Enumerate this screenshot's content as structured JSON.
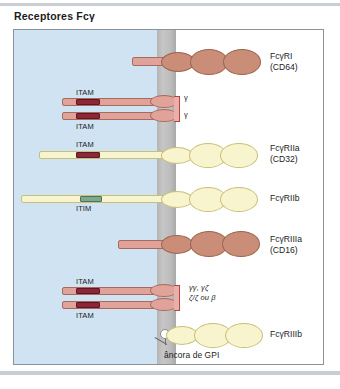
{
  "figure": {
    "title": "Receptores Fcγ",
    "regions": {
      "cytoplasm": "cytoplasm",
      "membrane": "plasma-membrane",
      "extracellular": "extracellular"
    },
    "colors": {
      "cytoplasm": "#cfe3f2",
      "membrane": "#bdbdbd",
      "ig_domain_brown": "#c98d78",
      "ig_domain_yellow": "#f8f4cd",
      "itam_box": "#8d2738",
      "itim_box": "#7fa98b",
      "stalk_pink": "#e0a299",
      "frame_border": "#8d9298"
    }
  },
  "receptors": [
    {
      "id": "fcgri",
      "name": "FcγRI",
      "cd": "(CD64)",
      "ig_domains": 3,
      "chain_tags": []
    },
    {
      "id": "fcgri-gamma",
      "name": "",
      "cd": "",
      "motifs": [
        "ITAM",
        "ITAM"
      ],
      "chain_tags": [
        "γ",
        "γ"
      ]
    },
    {
      "id": "fcgriia",
      "name": "FcγRIIa",
      "cd": "(CD32)",
      "ig_domains": 2,
      "motifs": [
        "ITAM"
      ]
    },
    {
      "id": "fcgriib",
      "name": "FcγRIIb",
      "cd": "",
      "ig_domains": 2,
      "motifs": [
        "ITIM"
      ]
    },
    {
      "id": "fcgriiia",
      "name": "FcγRIIIa",
      "cd": "(CD16)",
      "ig_domains": 2,
      "motifs": []
    },
    {
      "id": "fcgriiia-chains",
      "name": "",
      "cd": "",
      "motifs": [
        "ITAM",
        "ITAM"
      ],
      "chain_tags": [
        "γγ, γζ",
        "ζ/ζ ou β"
      ]
    },
    {
      "id": "fcgriiib",
      "name": "FcγRIIIb",
      "cd": "",
      "ig_domains": 2,
      "anchor": "âncora de GPI"
    }
  ],
  "labels": {
    "itam_1": "ITAM",
    "itam_2": "ITAM",
    "itam_3": "ITAM",
    "itam_4": "ITAM",
    "itam_5": "ITAM",
    "itim": "ITIM",
    "gamma_1": "γ",
    "gamma_2": "γ",
    "chains_line1": "γγ, γζ",
    "chains_line2": "ζ/ζ ou β",
    "gpi_anchor": "âncora de GPI",
    "fcgri_name": "FcγRI",
    "fcgri_cd": "(CD64)",
    "fcgriia_name": "FcγRIIa",
    "fcgriia_cd": "(CD32)",
    "fcgriib_name": "FcγRIIb",
    "fcgriiia_name": "FcγRIIIa",
    "fcgriiia_cd": "(CD16)",
    "fcgriiib_name": "FcγRIIIb"
  }
}
